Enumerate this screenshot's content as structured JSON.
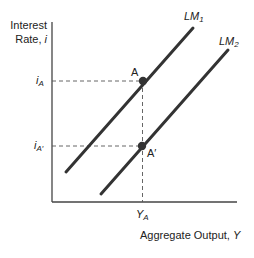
{
  "chart_data": {
    "type": "line",
    "title": "",
    "ylabel": "Interest Rate, i",
    "ylabel_lines": [
      "Interest",
      "Rate,"
    ],
    "ylabel_var": "i",
    "xlabel": "Aggregate Output, Y",
    "xlabel_text": "Aggregate Output,",
    "xlabel_var": "Y",
    "series": [
      {
        "name": "LM1",
        "label_main": "LM",
        "label_sub": "1",
        "points": [
          [
            66,
            172
          ],
          [
            193,
            28
          ]
        ]
      },
      {
        "name": "LM2",
        "label_main": "LM",
        "label_sub": "2",
        "points": [
          [
            101,
            194
          ],
          [
            228,
            50
          ]
        ]
      }
    ],
    "points": [
      {
        "name": "A",
        "label": "A",
        "x": 143,
        "y": 81
      },
      {
        "name": "A'",
        "label": "A′",
        "x": 142,
        "y": 146
      }
    ],
    "y_ticks": [
      {
        "main": "i",
        "sub": "A",
        "y": 81
      },
      {
        "main": "i",
        "sub": "A′",
        "y": 146
      }
    ],
    "x_ticks": [
      {
        "main": "Y",
        "sub": "A",
        "x": 142
      }
    ],
    "axes": {
      "origin": [
        52,
        202
      ],
      "y_top": 22,
      "x_right": 237
    },
    "grid": false,
    "colors": {
      "line": "#333333",
      "axis": "#444444",
      "dash": "#555555",
      "point": "#333333"
    }
  }
}
